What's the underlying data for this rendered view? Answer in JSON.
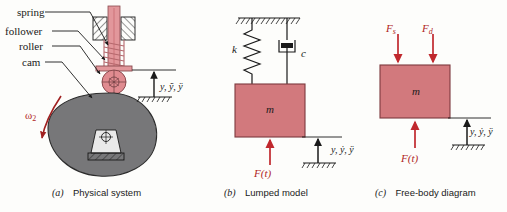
{
  "figure": {
    "background_color": "#fdfdfb",
    "mass_color": "#d2797d",
    "cam_color": "#777779",
    "roller_color": "#e08b90",
    "force_color": "#c0282d",
    "omega_color": "#a02020",
    "line_color": "#1a1a1a"
  },
  "panel_a": {
    "caption_letter": "(a)",
    "caption_text": "Physical system",
    "callouts": [
      {
        "label": "spring"
      },
      {
        "label": "follower"
      },
      {
        "label": "roller"
      },
      {
        "label": "cam"
      }
    ],
    "omega_label": "ω",
    "omega_subscript": "2",
    "motion_label": "y, ỹ, ÿ",
    "motion_label_parts": [
      "y",
      "ẏ",
      "ÿ"
    ]
  },
  "panel_b": {
    "caption_letter": "(b)",
    "caption_text": "Lumped model",
    "spring_label": "k",
    "damper_label": "c",
    "mass_label": "m",
    "force_label": "F(t)",
    "motion_label": "y, ẏ, ÿ"
  },
  "panel_c": {
    "caption_letter": "(c)",
    "caption_text": "Free-body diagram",
    "spring_force_label": "F",
    "spring_force_sub": "s",
    "damper_force_label": "F",
    "damper_force_sub": "d",
    "mass_label": "m",
    "force_label": "F(t)",
    "motion_label": "y, ẏ, ÿ"
  }
}
